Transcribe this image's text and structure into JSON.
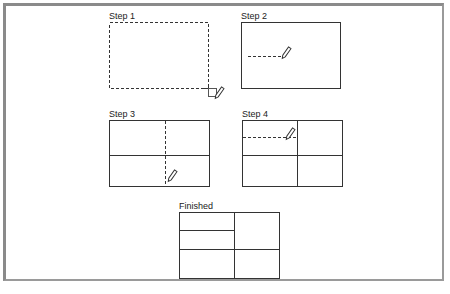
{
  "figure": {
    "steps": [
      {
        "label": "Step 1",
        "description": "Drag dashed rectangle to draw table outline"
      },
      {
        "label": "Step 2",
        "description": "Draw horizontal row line with pencil"
      },
      {
        "label": "Step 3",
        "description": "Draw vertical column line with pencil"
      },
      {
        "label": "Step 4",
        "description": "Draw additional row line in left column"
      },
      {
        "label": "Finished",
        "description": "Completed table grid"
      }
    ],
    "colors": {
      "line": "#333333",
      "frame": "#8a8a8a",
      "background": "#ffffff"
    }
  }
}
